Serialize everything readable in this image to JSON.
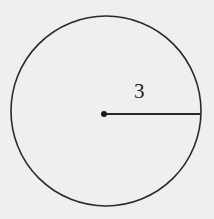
{
  "diagram": {
    "shape": "circle",
    "radius_label": "3",
    "colors": {
      "background": "#efefef",
      "stroke": "#2a2a2a"
    }
  }
}
